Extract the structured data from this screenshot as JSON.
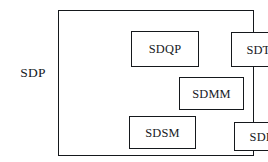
{
  "diagram": {
    "type": "block-diagram",
    "outer": {
      "label": "SDP",
      "label_position": "left-outside",
      "border_color": "#15181c",
      "background": "#ffffff"
    },
    "modules": [
      {
        "id": "sdqp",
        "label": "SDQP"
      },
      {
        "id": "sdtm",
        "label": "SDTM"
      },
      {
        "id": "sdmm",
        "label": "SDMM"
      },
      {
        "id": "sdsm",
        "label": "SDSM"
      },
      {
        "id": "sdim",
        "label": "SDIM"
      }
    ],
    "colors": {
      "ink": "#16191d",
      "stroke": "#15181c",
      "page": "#ffffff"
    }
  }
}
